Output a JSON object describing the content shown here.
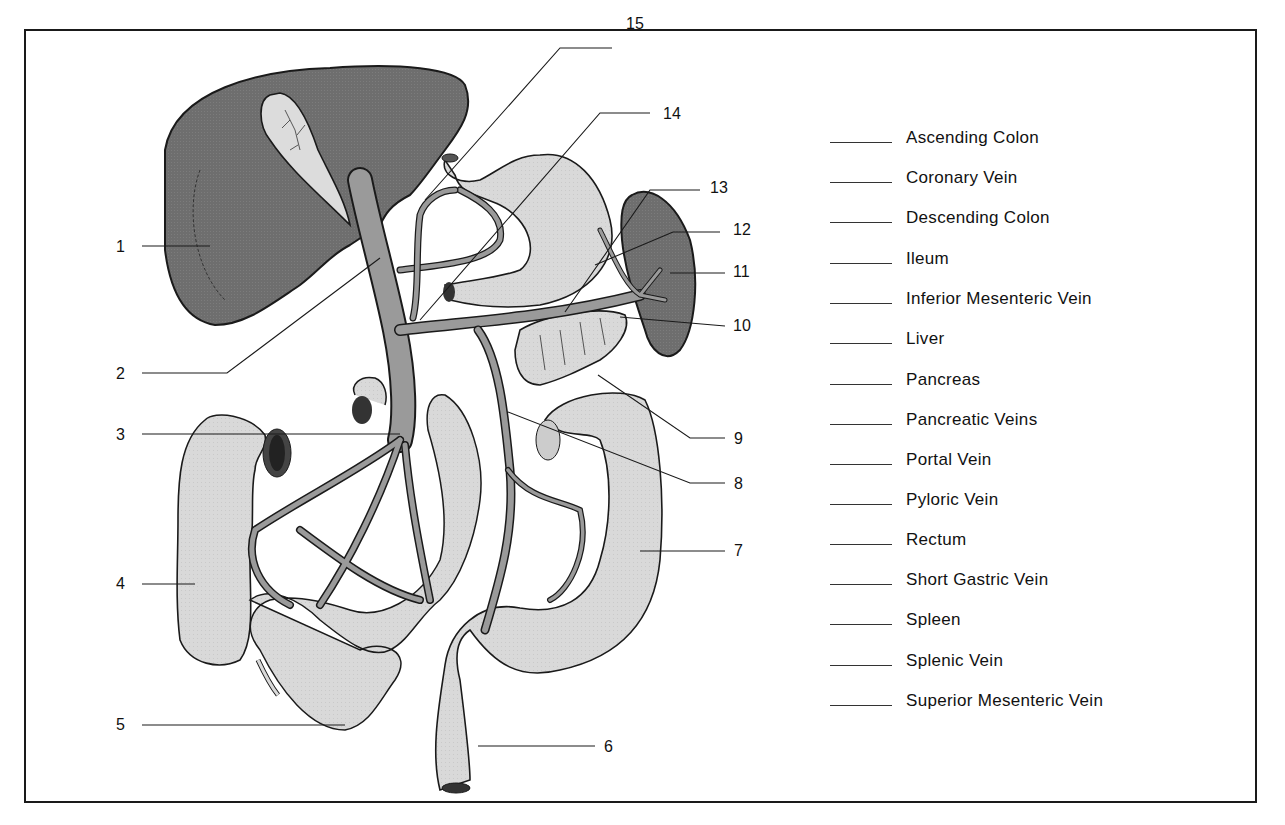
{
  "figure": {
    "colors": {
      "organ_dark": "#6e6e6e",
      "organ_light": "#d9d9d9",
      "vein": "#9a9a9a",
      "outline": "#1a1a1a",
      "background": "#ffffff"
    }
  },
  "callouts": [
    {
      "number": "1",
      "x": 116,
      "y": 239
    },
    {
      "number": "2",
      "x": 116,
      "y": 366
    },
    {
      "number": "3",
      "x": 116,
      "y": 427
    },
    {
      "number": "4",
      "x": 116,
      "y": 576
    },
    {
      "number": "5",
      "x": 116,
      "y": 717
    },
    {
      "number": "6",
      "x": 604,
      "y": 739
    },
    {
      "number": "7",
      "x": 734,
      "y": 543
    },
    {
      "number": "8",
      "x": 734,
      "y": 476
    },
    {
      "number": "9",
      "x": 734,
      "y": 431
    },
    {
      "number": "10",
      "x": 733,
      "y": 318
    },
    {
      "number": "11",
      "x": 733,
      "y": 264
    },
    {
      "number": "12",
      "x": 733,
      "y": 222
    },
    {
      "number": "13",
      "x": 710,
      "y": 180
    },
    {
      "number": "14",
      "x": 663,
      "y": 106
    },
    {
      "number": "15",
      "x": 626,
      "y": 16
    }
  ],
  "answer_key": {
    "items": [
      {
        "label": "Ascending Colon",
        "y": 128
      },
      {
        "label": "Coronary Vein",
        "y": 168
      },
      {
        "label": "Descending Colon",
        "y": 208
      },
      {
        "label": "Ileum",
        "y": 249
      },
      {
        "label": "Inferior Mesenteric Vein",
        "y": 289
      },
      {
        "label": "Liver",
        "y": 329
      },
      {
        "label": "Pancreas",
        "y": 370
      },
      {
        "label": "Pancreatic Veins",
        "y": 410
      },
      {
        "label": "Portal Vein",
        "y": 450
      },
      {
        "label": "Pyloric Vein",
        "y": 490
      },
      {
        "label": "Rectum",
        "y": 530
      },
      {
        "label": "Short Gastric Vein",
        "y": 570
      },
      {
        "label": "Spleen",
        "y": 610
      },
      {
        "label": "Splenic Vein",
        "y": 651
      },
      {
        "label": "Superior Mesenteric Vein",
        "y": 691
      }
    ]
  }
}
